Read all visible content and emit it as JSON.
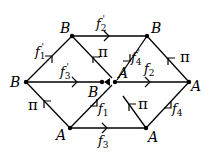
{
  "diagram": {
    "vertices": [
      {
        "id": "top_left",
        "label": "B",
        "x": 72,
        "y": 36
      },
      {
        "id": "top_right",
        "label": "B",
        "x": 147,
        "y": 36
      },
      {
        "id": "left",
        "label": "B",
        "x": 26,
        "y": 82
      },
      {
        "id": "center_b",
        "label": "B",
        "x": 102,
        "y": 82
      },
      {
        "id": "center_a",
        "label": "A",
        "x": 115,
        "y": 82
      },
      {
        "id": "right",
        "label": "A",
        "x": 189,
        "y": 82
      },
      {
        "id": "bottom_left",
        "label": "A",
        "x": 70,
        "y": 128
      },
      {
        "id": "bottom_right",
        "label": "A",
        "x": 146,
        "y": 128
      }
    ],
    "edge_labels": {
      "f1p": {
        "base": "f",
        "sub": "1",
        "prime": "'"
      },
      "f2p": {
        "base": "f",
        "sub": "2",
        "prime": "'"
      },
      "f3p": {
        "base": "f",
        "sub": "3",
        "prime": "'"
      },
      "f4p": {
        "base": "f",
        "sub": "4",
        "prime": "'"
      },
      "f1": {
        "base": "f",
        "sub": "1"
      },
      "f2": {
        "base": "f",
        "sub": "2"
      },
      "f3": {
        "base": "f",
        "sub": "3"
      },
      "f4": {
        "base": "f",
        "sub": "4"
      },
      "pi": "π"
    }
  }
}
